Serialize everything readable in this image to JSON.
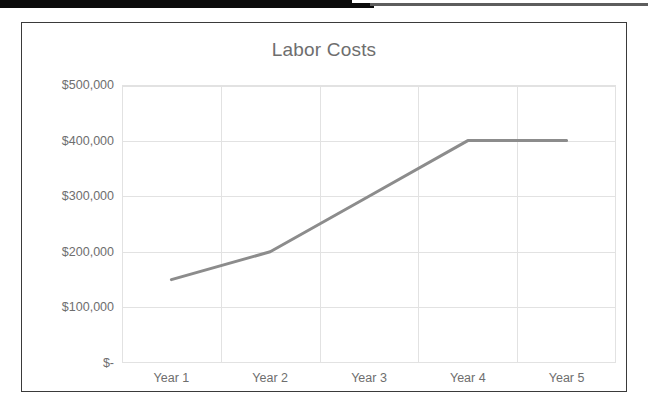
{
  "page": {
    "background_color": "#ffffff",
    "scan_artifact": {
      "name": "scan-edge-bar",
      "dark_color": "#0b0b0b",
      "light_color": "#5d5d5d"
    }
  },
  "chart_frame": {
    "border_color": "#3a3a3a"
  },
  "chart_data": {
    "type": "line",
    "title": "Labor Costs",
    "xlabel": "",
    "ylabel": "",
    "categories": [
      "Year 1",
      "Year 2",
      "Year 3",
      "Year 4",
      "Year 5"
    ],
    "values": [
      150000,
      200000,
      300000,
      400000,
      400000
    ],
    "series": [
      {
        "name": "Labor Costs",
        "values": [
          150000,
          200000,
          300000,
          400000,
          400000
        ],
        "color": "#8c8c8c"
      }
    ],
    "ylim": [
      0,
      500000
    ],
    "ytick_values": [
      500000,
      400000,
      300000,
      200000,
      100000,
      0
    ],
    "ytick_labels": [
      "$500,000",
      "$400,000",
      "$300,000",
      "$200,000",
      "$100,000",
      "$-"
    ],
    "xtick_labels": [
      "Year 1",
      "Year 2",
      "Year 3",
      "Year 4",
      "Year 5"
    ],
    "grid": true,
    "grid_color": "#e2e2e2",
    "legend": false,
    "legend_position": "none",
    "markers": false,
    "line_color": "#8c8c8c",
    "line_width": 3,
    "tick_label_color": "#6e6e6e",
    "title_color": "#6e6e6e"
  }
}
